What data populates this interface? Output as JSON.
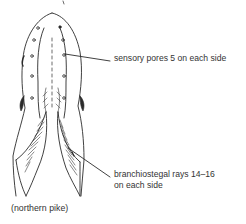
{
  "figure": {
    "colors": {
      "line": "#2b2b2b",
      "text": "#333333",
      "background": "#ffffff"
    },
    "callouts": [
      {
        "id": "sensory-pores",
        "text": "sensory pores 5 on each side"
      },
      {
        "id": "branchiostegal-rays",
        "line1": "branchiostegal rays 14–16",
        "line2": "on each side"
      }
    ],
    "caption": "(northern pike)"
  }
}
